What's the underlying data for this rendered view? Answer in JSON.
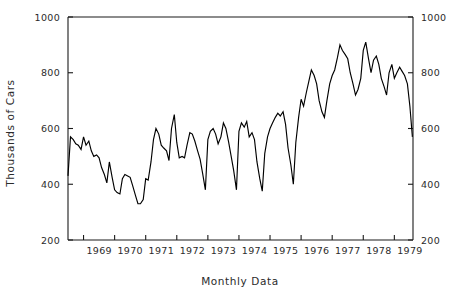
{
  "chart_data": {
    "type": "line",
    "title": "",
    "xlabel": "Monthly Data",
    "ylabel": "Thousands of Cars",
    "ylim": [
      200,
      1000
    ],
    "yticks": [
      200,
      400,
      600,
      800,
      1000
    ],
    "ytick_labels": [
      "200",
      "400",
      "600",
      "800",
      "1000"
    ],
    "ytick_labels_right": [
      "200",
      "400",
      "600",
      "800",
      "1000"
    ],
    "grid": false,
    "legend": null,
    "dual_y_axis": true,
    "xtick_labels": [
      "1969",
      "1970",
      "1971",
      "1972",
      "1973",
      "1974",
      "1975",
      "1976",
      "1977",
      "1978",
      "1979"
    ],
    "x_start": 1968.5,
    "x_end": 1979.6,
    "x_tick_values": [
      1969.0,
      1970.0,
      1971.0,
      1972.0,
      1973.0,
      1974.0,
      1975.0,
      1976.0,
      1977.0,
      1978.0,
      1979.0
    ],
    "series": [
      {
        "name": "Monthly car sales",
        "units": "thousands of cars",
        "x": [
          1968.5,
          1968.58,
          1968.67,
          1968.75,
          1968.83,
          1968.92,
          1969.0,
          1969.08,
          1969.17,
          1969.25,
          1969.33,
          1969.42,
          1969.5,
          1969.58,
          1969.67,
          1969.75,
          1969.83,
          1969.92,
          1970.0,
          1970.08,
          1970.17,
          1970.25,
          1970.33,
          1970.42,
          1970.5,
          1970.58,
          1970.67,
          1970.75,
          1970.83,
          1970.92,
          1971.0,
          1971.08,
          1971.17,
          1971.25,
          1971.33,
          1971.42,
          1971.5,
          1971.58,
          1971.67,
          1971.75,
          1971.83,
          1971.92,
          1972.0,
          1972.08,
          1972.17,
          1972.25,
          1972.33,
          1972.42,
          1972.5,
          1972.58,
          1972.67,
          1972.75,
          1972.83,
          1972.92,
          1973.0,
          1973.08,
          1973.17,
          1973.25,
          1973.33,
          1973.42,
          1973.5,
          1973.58,
          1973.67,
          1973.75,
          1973.83,
          1973.92,
          1974.0,
          1974.08,
          1974.17,
          1974.25,
          1974.33,
          1974.42,
          1974.5,
          1974.58,
          1974.67,
          1974.75,
          1974.83,
          1974.92,
          1975.0,
          1975.08,
          1975.17,
          1975.25,
          1975.33,
          1975.42,
          1975.5,
          1975.58,
          1975.67,
          1975.75,
          1975.83,
          1975.92,
          1976.0,
          1976.08,
          1976.17,
          1976.25,
          1976.33,
          1976.42,
          1976.5,
          1976.58,
          1976.67,
          1976.75,
          1976.83,
          1976.92,
          1977.0,
          1977.08,
          1977.17,
          1977.25,
          1977.33,
          1977.42,
          1977.5,
          1977.58,
          1977.67,
          1977.75,
          1977.83,
          1977.92,
          1978.0,
          1978.08,
          1978.17,
          1978.25,
          1978.33,
          1978.42,
          1978.5,
          1978.58,
          1978.67,
          1978.75,
          1978.83,
          1978.92,
          1979.0,
          1979.08,
          1979.17,
          1979.25,
          1979.33,
          1979.42,
          1979.5,
          1979.58
        ],
        "values": [
          430,
          570,
          560,
          545,
          540,
          525,
          570,
          540,
          555,
          520,
          500,
          505,
          495,
          460,
          435,
          405,
          480,
          425,
          380,
          370,
          365,
          420,
          435,
          430,
          425,
          395,
          360,
          330,
          330,
          345,
          420,
          415,
          480,
          560,
          600,
          580,
          540,
          530,
          520,
          485,
          600,
          650,
          550,
          495,
          500,
          495,
          540,
          585,
          580,
          555,
          520,
          490,
          440,
          380,
          560,
          590,
          600,
          580,
          545,
          570,
          620,
          600,
          550,
          500,
          450,
          380,
          590,
          620,
          605,
          625,
          570,
          585,
          560,
          480,
          420,
          375,
          510,
          570,
          600,
          620,
          640,
          655,
          645,
          660,
          615,
          530,
          470,
          400,
          550,
          640,
          705,
          680,
          730,
          770,
          810,
          790,
          760,
          700,
          660,
          640,
          700,
          760,
          790,
          810,
          855,
          900,
          880,
          865,
          850,
          800,
          760,
          720,
          740,
          780,
          880,
          910,
          850,
          800,
          845,
          860,
          830,
          780,
          750,
          720,
          800,
          830,
          780,
          800,
          820,
          805,
          790,
          760,
          680,
          570
        ]
      }
    ]
  },
  "axes": {
    "left_tick_labels": [
      "1000",
      "800",
      "600",
      "400",
      "200"
    ],
    "right_tick_labels": [
      "1000",
      "800",
      "600",
      "400",
      "200"
    ],
    "x_tick_labels": [
      "1969",
      "1970",
      "1971",
      "1972",
      "1973",
      "1974",
      "1975",
      "1976",
      "1977",
      "1978",
      "1979"
    ],
    "y_axis_title": "Thousands of Cars",
    "x_axis_title": "Monthly Data"
  },
  "style": {
    "line_color": "#000000",
    "axis_color": "#1a1a1a",
    "text_color": "#2b2b2b",
    "background": "#ffffff"
  }
}
